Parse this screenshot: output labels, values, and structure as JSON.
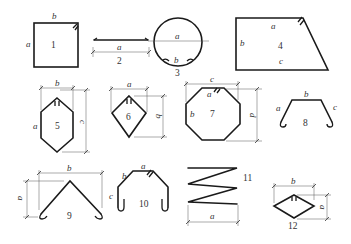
{
  "diagram": {
    "colors": {
      "line": "#1a1a1a",
      "dimension": "#555555",
      "text": "#333333",
      "background": "#ffffff"
    },
    "shapes": [
      {
        "id": "1",
        "number": "1",
        "labels": {
          "a": "a",
          "b": "b"
        }
      },
      {
        "id": "2",
        "number": "2",
        "labels": {
          "a": "a"
        }
      },
      {
        "id": "3",
        "number": "3",
        "labels": {
          "a": "a",
          "b": "b"
        }
      },
      {
        "id": "4",
        "number": "4",
        "labels": {
          "a": "a",
          "b": "b",
          "c": "c"
        }
      },
      {
        "id": "5",
        "number": "5",
        "labels": {
          "a": "a",
          "b": "b",
          "c": "c"
        }
      },
      {
        "id": "6",
        "number": "6",
        "labels": {
          "a": "a",
          "b": "b"
        }
      },
      {
        "id": "7",
        "number": "7",
        "labels": {
          "a": "a",
          "b": "b",
          "c": "c",
          "d": "d"
        }
      },
      {
        "id": "8",
        "number": "8",
        "labels": {
          "a": "a",
          "b": "b",
          "c": "c"
        }
      },
      {
        "id": "9",
        "number": "9",
        "labels": {
          "a": "a",
          "b": "b"
        }
      },
      {
        "id": "10",
        "number": "10",
        "labels": {
          "a": "a",
          "b": "b",
          "c": "c"
        }
      },
      {
        "id": "11",
        "number": "11",
        "labels": {
          "a": "a"
        }
      },
      {
        "id": "12",
        "number": "12",
        "labels": {
          "a": "a",
          "b": "b"
        }
      }
    ]
  }
}
